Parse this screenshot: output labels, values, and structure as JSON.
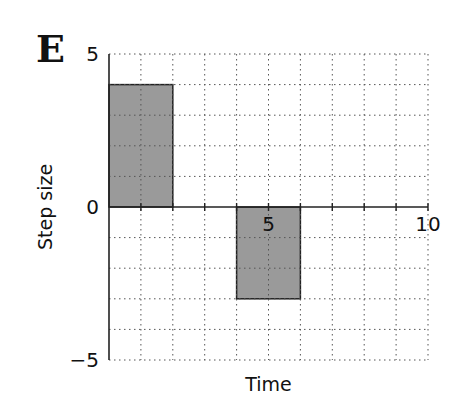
{
  "panel_label": "E",
  "chart_data": {
    "type": "bar",
    "title": "",
    "xlabel": "Time",
    "ylabel": "Step size",
    "xlim": [
      0,
      10
    ],
    "ylim": [
      -5,
      5
    ],
    "xticks": [
      5,
      10
    ],
    "yticks": [
      -5,
      0,
      5
    ],
    "grid": true,
    "bars": [
      {
        "x_start": 0,
        "x_end": 2,
        "value": 4
      },
      {
        "x_start": 4,
        "x_end": 6,
        "value": -3
      }
    ],
    "bar_color": "#9a9a9a"
  }
}
